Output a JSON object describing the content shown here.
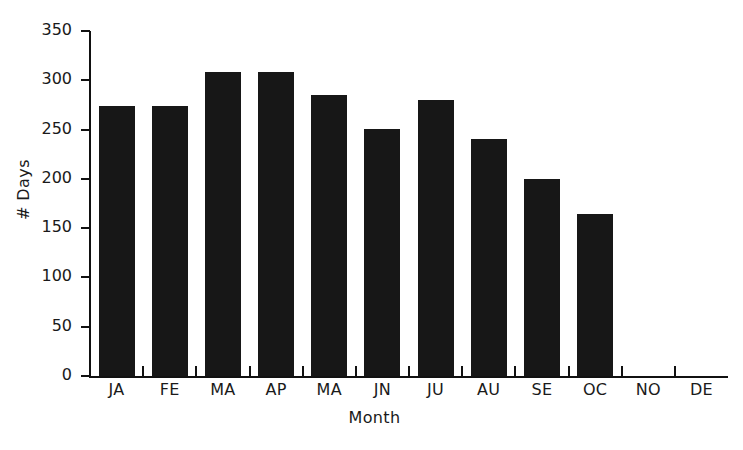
{
  "chart_data": {
    "type": "bar",
    "title": "",
    "subtitle": "",
    "xlabel": "Month",
    "ylabel": "# Days",
    "categories": [
      "JA",
      "FE",
      "MA",
      "AP",
      "MA",
      "JN",
      "JU",
      "AU",
      "SE",
      "OC",
      "NO",
      "DE"
    ],
    "values": [
      274,
      274,
      308,
      308,
      285,
      251,
      280,
      240,
      200,
      164,
      0,
      0
    ],
    "ylim": [
      0,
      350
    ],
    "yticks": [
      0,
      50,
      100,
      150,
      200,
      250,
      300,
      350
    ],
    "ytick_labels": [
      "0",
      "50",
      "100",
      "150",
      "200",
      "250",
      "300",
      "350"
    ],
    "grid": false,
    "legend": null,
    "bar_color": "#171717",
    "axis_color": "#111111",
    "background": "#ffffff",
    "annotations": []
  }
}
